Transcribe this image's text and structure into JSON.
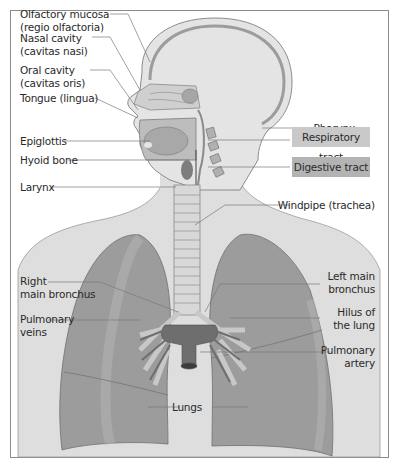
{
  "diagram": {
    "labels_left": [
      {
        "id": "olfactory-mucosa",
        "line1": "Olfactory mucosa",
        "line2": "(regio olfactoria)"
      },
      {
        "id": "nasal-cavity",
        "line1": "Nasal cavity",
        "line2": "(cavitas nasi)"
      },
      {
        "id": "oral-cavity",
        "line1": "Oral cavity",
        "line2": "(cavitas oris)"
      },
      {
        "id": "tongue",
        "line1": "Tongue (lingua)"
      },
      {
        "id": "epiglottis",
        "line1": "Epiglottis"
      },
      {
        "id": "hyoid-bone",
        "line1": "Hyoid bone"
      },
      {
        "id": "larynx",
        "line1": "Larynx"
      },
      {
        "id": "right-main-bronchus",
        "line1": "Right",
        "line2": "main bronchus"
      },
      {
        "id": "pulmonary-veins",
        "line1": "Pulmonary",
        "line2": "veins"
      }
    ],
    "labels_right": [
      {
        "id": "pharynx",
        "line1": "Pharynx"
      },
      {
        "id": "windpipe",
        "line1": "Windpipe (trachea)"
      },
      {
        "id": "left-main-bronchus",
        "line1": "Left main",
        "line2": "bronchus"
      },
      {
        "id": "hilus",
        "line1": "Hilus of",
        "line2": "the lung"
      },
      {
        "id": "pulmonary-artery",
        "line1": "Pulmonary",
        "line2": "artery"
      }
    ],
    "label_bottom": {
      "id": "lungs",
      "line1": "Lungs"
    },
    "legend": [
      {
        "label": "Respiratory tract",
        "color": "#c9c9c9"
      },
      {
        "label": "Digestive tract",
        "color": "#b3b3b3"
      }
    ],
    "colors": {
      "skin": "#dcdcdc",
      "head_fill": "#e2e2e2",
      "lung": "#9a9a9a",
      "lung_light": "#b8b8b8",
      "vessel": "#6e6e6e",
      "trachea": "#d6d6d6",
      "leader_line": "#7a7a7a",
      "frame": "#8a8a8a"
    }
  }
}
